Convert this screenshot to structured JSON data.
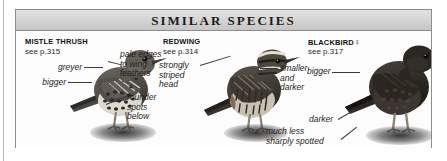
{
  "panel": {
    "header_title": "SIMILAR  SPECIES"
  },
  "species": [
    {
      "name": "MISTLE THRUSH",
      "page_ref": "see p.315",
      "sex_symbol": "",
      "labels": [
        {
          "id": "greyer",
          "text": "greyer"
        },
        {
          "id": "bigger",
          "text": "bigger"
        },
        {
          "id": "pale-edges",
          "text": "pale edges\nto wing\nfeathers"
        },
        {
          "id": "rounder-spots",
          "text": "rounder\nspots\nbelow"
        }
      ]
    },
    {
      "name": "REDWING",
      "page_ref": "see p.314",
      "sex_symbol": "",
      "labels": [
        {
          "id": "striped-head",
          "text": "strongly\nstriped\nhead"
        },
        {
          "id": "smaller-darker",
          "text": "smaller\nand\ndarker"
        }
      ]
    },
    {
      "name": "BLACKBIRD",
      "page_ref": "see p.317",
      "sex_symbol": "♀",
      "labels": [
        {
          "id": "bigger-blackbird",
          "text": "bigger"
        },
        {
          "id": "darker",
          "text": "darker"
        },
        {
          "id": "less-spotted",
          "text": "much less\nsharply spotted"
        }
      ]
    }
  ],
  "labels_flat": {
    "greyer": "greyer",
    "bigger": "bigger",
    "pale_edges_1": "pale edges",
    "pale_edges_2": "to wing",
    "pale_edges_3": "feathers",
    "rounder_1": "rounder",
    "rounder_2": "spots",
    "rounder_3": "below",
    "striped_1": "strongly",
    "striped_2": "striped",
    "striped_3": "head",
    "smaller_1": "smaller",
    "smaller_2": "and",
    "smaller_3": "darker",
    "bigger_bb": "bigger",
    "darker_bb": "darker",
    "less_spotted_1": "much less",
    "less_spotted_2": "sharply spotted"
  },
  "colors": {
    "header_band": "#d3d3d3",
    "panel_border": "#8d8d8d",
    "text": "#1b1b1b",
    "background": "#ffffff"
  },
  "illustrations": [
    {
      "id": "mistle-thrush-illustration",
      "alt": "grey-brown speckled thrush standing on ground"
    },
    {
      "id": "redwing-illustration",
      "alt": "dark heavily streaked redwing standing on ground"
    },
    {
      "id": "blackbird-illustration",
      "alt": "dark female blackbird with pale bill standing on ground"
    }
  ]
}
